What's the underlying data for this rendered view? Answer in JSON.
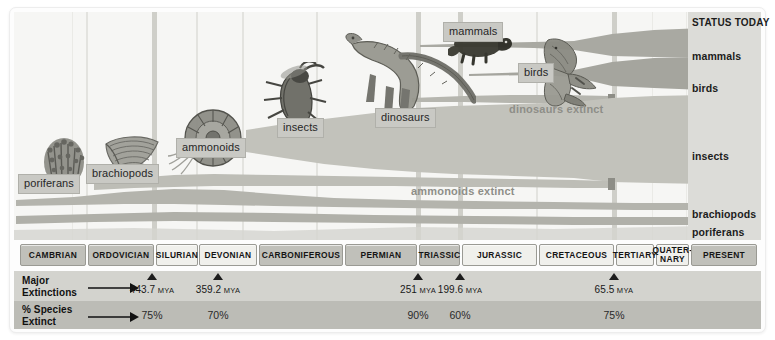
{
  "status_panel": {
    "title": "STATUS TODAY",
    "items": [
      {
        "label": "mammals",
        "top": 38
      },
      {
        "label": "birds",
        "top": 70
      },
      {
        "label": "insects",
        "top": 138
      },
      {
        "label": "brachiopods",
        "top": 196
      },
      {
        "label": "poriferans",
        "top": 214
      }
    ]
  },
  "callouts": [
    {
      "label": "poriferans",
      "x": 18,
      "y": 174
    },
    {
      "label": "brachiopods",
      "x": 86,
      "y": 164
    },
    {
      "label": "ammonoids",
      "x": 176,
      "y": 138
    },
    {
      "label": "insects",
      "x": 277,
      "y": 118
    },
    {
      "label": "dinosaurs",
      "x": 375,
      "y": 108
    },
    {
      "label": "mammals",
      "x": 443,
      "y": 22
    },
    {
      "label": "birds",
      "x": 518,
      "y": 63
    }
  ],
  "plain_labels": [
    {
      "label": "dinosaurs extinct",
      "x": 509,
      "y": 103
    },
    {
      "label": "ammonoids extinct",
      "x": 411,
      "y": 185
    }
  ],
  "periods": [
    {
      "name": "CAMBRIAN",
      "x": 20,
      "w": 66,
      "tone": "dark"
    },
    {
      "name": "ORDOVICIAN",
      "x": 88,
      "w": 66,
      "tone": "dark"
    },
    {
      "name": "SILURIAN",
      "x": 156,
      "w": 42,
      "tone": "light"
    },
    {
      "name": "DEVONIAN",
      "x": 199,
      "w": 58,
      "tone": "light"
    },
    {
      "name": "CARBONIFEROUS",
      "x": 259,
      "w": 84,
      "tone": "dark"
    },
    {
      "name": "PERMIAN",
      "x": 345,
      "w": 72,
      "tone": "dark"
    },
    {
      "name": "TRIASSIC",
      "x": 419,
      "w": 41,
      "tone": "dark"
    },
    {
      "name": "JURASSIC",
      "x": 462,
      "w": 75,
      "tone": "light"
    },
    {
      "name": "CRETACEOUS",
      "x": 539,
      "w": 75,
      "tone": "light"
    },
    {
      "name": "TERTIARY",
      "x": 616,
      "w": 38,
      "tone": "light"
    },
    {
      "name": "QUATER-\nNARY",
      "x": 656,
      "w": 33,
      "tone": "light"
    },
    {
      "name": "PRESENT",
      "x": 691,
      "w": 66,
      "tone": "dark"
    }
  ],
  "rows": {
    "extinctions_label": "Major\nExtinctions",
    "percent_label": "% Species\nExtinct"
  },
  "chart_data": {
    "type": "area",
    "xlabel": "Geologic period",
    "ylabel": "Relative abundance / diversity",
    "grid": true,
    "legend": "right",
    "x_categories": [
      "CAMBRIAN",
      "ORDOVICIAN",
      "SILURIAN",
      "DEVONIAN",
      "CARBONIFEROUS",
      "PERMIAN",
      "TRIASSIC",
      "JURASSIC",
      "CRETACEOUS",
      "TERTIARY",
      "QUATERNARY",
      "PRESENT"
    ],
    "extinction_events": [
      {
        "mya": "443.7",
        "unit": "MYA",
        "percent": "75%",
        "x": 152
      },
      {
        "mya": "359.2",
        "unit": "MYA",
        "percent": "70%",
        "x": 218
      },
      {
        "mya": "251",
        "unit": "MYA",
        "percent": "90%",
        "x": 418
      },
      {
        "mya": "199.6",
        "unit": "MYA",
        "percent": "60%",
        "x": 460
      },
      {
        "mya": "65.5",
        "unit": "MYA",
        "percent": "75%",
        "x": 614
      }
    ],
    "series": [
      {
        "name": "mammals",
        "status_today": "mammals",
        "extinct": false,
        "first_x": 420,
        "note": "expands strongly after 65.5 MYA"
      },
      {
        "name": "birds",
        "status_today": "birds",
        "extinct": false,
        "first_x": 470,
        "note": "expands after 65.5 MYA"
      },
      {
        "name": "insects",
        "status_today": "insects",
        "extinct": false,
        "first_x": 245,
        "note": "widest band, continuously expanding to present"
      },
      {
        "name": "dinosaurs",
        "status_today": "extinct",
        "extinct": true,
        "first_x": 418,
        "last_x": 614,
        "note": "dinosaurs extinct at 65.5 MYA"
      },
      {
        "name": "ammonoids",
        "status_today": "extinct",
        "extinct": true,
        "first_x": 90,
        "last_x": 614,
        "note": "ammonoids extinct at 65.5 MYA"
      },
      {
        "name": "brachiopods",
        "status_today": "brachiopods",
        "extinct": false,
        "first_x": 16,
        "note": "peaks in Paleozoic then narrows"
      },
      {
        "name": "poriferans",
        "status_today": "poriferans",
        "extinct": false,
        "first_x": 16,
        "note": "thin persistent band across whole timeline"
      }
    ]
  }
}
